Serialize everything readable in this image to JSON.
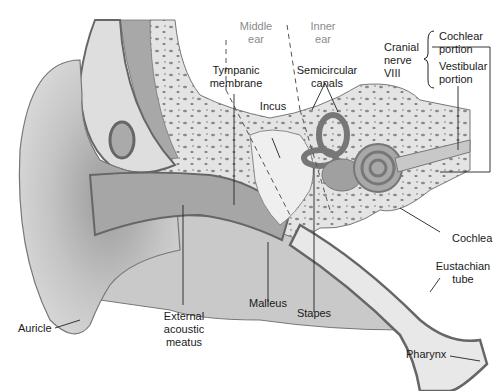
{
  "diagram": {
    "regions": [
      {
        "id": "middle",
        "label_line1": "Middle",
        "label_line2": "ear"
      },
      {
        "id": "inner",
        "label_line1": "Inner",
        "label_line2": "ear"
      }
    ],
    "labels": {
      "tympanic_1": "Tympanic",
      "tympanic_2": "membrane",
      "incus": "Incus",
      "semicircular_1": "Semicircular",
      "semicircular_2": "canals",
      "cranial_1": "Cranial",
      "cranial_2": "nerve",
      "cranial_3": "VIII",
      "cochlear_1": "Cochlear",
      "cochlear_2": "portion",
      "vestibular_1": "Vestibular",
      "vestibular_2": "portion",
      "cochlea": "Cochlea",
      "eustachian_1": "Eustachian",
      "eustachian_2": "tube",
      "pharynx": "Pharynx",
      "stapes": "Stapes",
      "malleus": "Malleus",
      "external_1": "External",
      "external_2": "acoustic",
      "external_3": "meatus",
      "auricle": "Auricle"
    },
    "colors": {
      "tissue_light": "#d9d9d9",
      "tissue_mid": "#b8b8b8",
      "tissue_dark": "#8c8c8c",
      "outline": "#6e6e6e",
      "bone": "#e6e6e6",
      "bone_spots": "#8a8a8a",
      "leader": "#222222"
    }
  }
}
